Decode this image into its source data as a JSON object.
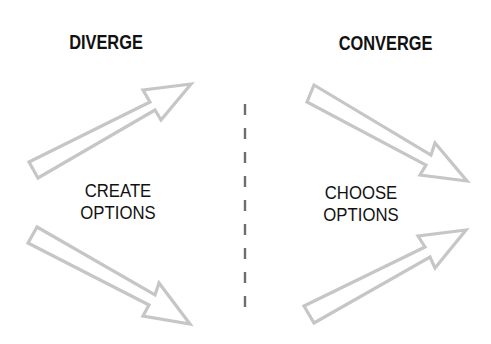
{
  "diagram": {
    "left_section": {
      "heading": "DIVERGE",
      "label_line1": "CREATE",
      "label_line2": "OPTIONS"
    },
    "right_section": {
      "heading": "CONVERGE",
      "label_line1": "CHOOSE",
      "label_line2": "OPTIONS"
    },
    "divider": {
      "style": "dashed",
      "color": "#6e6e6e"
    },
    "arrows": [
      {
        "id": "diverge-up",
        "direction": "up-right"
      },
      {
        "id": "diverge-down",
        "direction": "down-right"
      },
      {
        "id": "converge-down",
        "direction": "down-right"
      },
      {
        "id": "converge-up",
        "direction": "up-right"
      }
    ],
    "colors": {
      "text": "#111111",
      "arrow_outline": "#c4c4c4",
      "background": "#ffffff"
    }
  }
}
